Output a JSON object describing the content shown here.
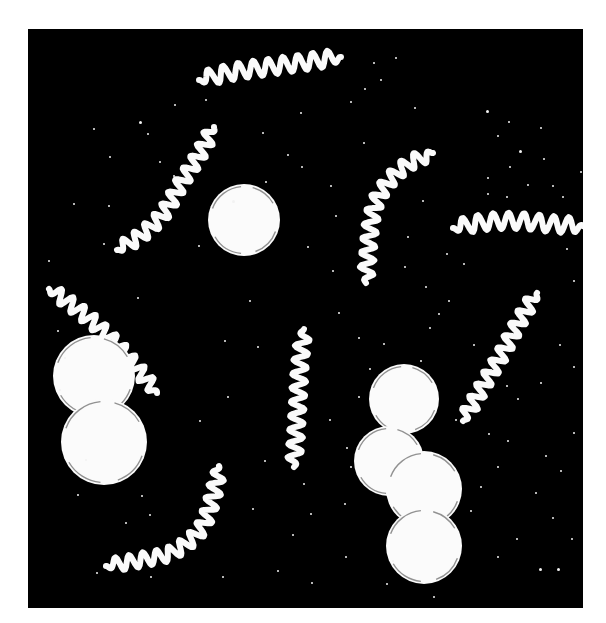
{
  "figure": {
    "kind": "darkfield-micrograph-illustration",
    "caption": "",
    "canvas": {
      "width": 606,
      "height": 623
    },
    "background_color": "#ffffff",
    "plate": {
      "x": 28,
      "y": 29,
      "width": 555,
      "height": 579,
      "fill_color": "#000000"
    },
    "organism_color": "#fafafa",
    "speck_color": "#f2f2f2"
  },
  "cocci": [
    {
      "name": "solitary-coccus",
      "cx": 244,
      "cy": 220,
      "r": 36
    },
    {
      "name": "diplococcus-upper",
      "cx": 94,
      "cy": 376,
      "r": 41
    },
    {
      "name": "diplococcus-lower",
      "cx": 104,
      "cy": 442,
      "r": 43
    },
    {
      "name": "chain-coccus-1",
      "cx": 404,
      "cy": 399,
      "r": 35
    },
    {
      "name": "chain-coccus-2",
      "cx": 389,
      "cy": 461,
      "r": 35
    },
    {
      "name": "chain-coccus-3",
      "cx": 424,
      "cy": 489,
      "r": 38
    },
    {
      "name": "chain-coccus-4",
      "cx": 424,
      "cy": 546,
      "r": 38
    }
  ],
  "spirochetes": [
    {
      "name": "spirochete-top",
      "points": [
        [
          199,
          80
        ],
        [
          232,
          72
        ],
        [
          268,
          67
        ],
        [
          305,
          62
        ],
        [
          341,
          57
        ]
      ],
      "amplitude": 8,
      "wavelength": 15,
      "thickness": 6
    },
    {
      "name": "spirochete-upper-left-s",
      "points": [
        [
          117,
          250
        ],
        [
          140,
          236
        ],
        [
          163,
          214
        ],
        [
          180,
          185
        ],
        [
          199,
          155
        ],
        [
          214,
          127
        ]
      ],
      "amplitude": 7,
      "wavelength": 14,
      "thickness": 6
    },
    {
      "name": "spirochete-left-diagonal",
      "points": [
        [
          49,
          289
        ],
        [
          76,
          308
        ],
        [
          104,
          332
        ],
        [
          130,
          360
        ],
        [
          157,
          393
        ]
      ],
      "amplitude": 7,
      "wavelength": 14,
      "thickness": 6
    },
    {
      "name": "spirochete-center-vertical",
      "points": [
        [
          304,
          329
        ],
        [
          300,
          365
        ],
        [
          298,
          400
        ],
        [
          296,
          433
        ],
        [
          294,
          467
        ]
      ],
      "amplitude": 7,
      "wavelength": 14,
      "thickness": 6
    },
    {
      "name": "spirochete-bottom-left-hook",
      "points": [
        [
          106,
          566
        ],
        [
          140,
          560
        ],
        [
          173,
          552
        ],
        [
          200,
          530
        ],
        [
          213,
          497
        ],
        [
          219,
          466
        ]
      ],
      "amplitude": 7,
      "wavelength": 14,
      "thickness": 6
    },
    {
      "name": "spirochete-upper-right-hook",
      "points": [
        [
          433,
          153
        ],
        [
          410,
          163
        ],
        [
          390,
          180
        ],
        [
          375,
          205
        ],
        [
          369,
          240
        ],
        [
          366,
          283
        ]
      ],
      "amplitude": 7,
      "wavelength": 14,
      "thickness": 6
    },
    {
      "name": "spirochete-right-horizontal",
      "points": [
        [
          453,
          228
        ],
        [
          486,
          222
        ],
        [
          519,
          221
        ],
        [
          552,
          224
        ],
        [
          583,
          226
        ]
      ],
      "amplitude": 8,
      "wavelength": 15,
      "thickness": 6
    },
    {
      "name": "spirochete-right-diagonal",
      "points": [
        [
          463,
          421
        ],
        [
          483,
          386
        ],
        [
          503,
          352
        ],
        [
          520,
          320
        ],
        [
          537,
          293
        ]
      ],
      "amplitude": 7,
      "wavelength": 14,
      "thickness": 6
    }
  ],
  "specks": [
    {
      "x": 139,
      "y": 121,
      "s": 3
    },
    {
      "x": 147,
      "y": 133,
      "s": 2
    },
    {
      "x": 109,
      "y": 156,
      "s": 2
    },
    {
      "x": 108,
      "y": 205,
      "s": 2
    },
    {
      "x": 159,
      "y": 161,
      "s": 2
    },
    {
      "x": 173,
      "y": 175,
      "s": 2
    },
    {
      "x": 103,
      "y": 243,
      "s": 2
    },
    {
      "x": 232,
      "y": 200,
      "s": 3
    },
    {
      "x": 265,
      "y": 181,
      "s": 2
    },
    {
      "x": 198,
      "y": 245,
      "s": 2
    },
    {
      "x": 300,
      "y": 112,
      "s": 2
    },
    {
      "x": 373,
      "y": 62,
      "s": 2
    },
    {
      "x": 395,
      "y": 57,
      "s": 2
    },
    {
      "x": 380,
      "y": 79,
      "s": 2
    },
    {
      "x": 350,
      "y": 101,
      "s": 2
    },
    {
      "x": 364,
      "y": 88,
      "s": 2
    },
    {
      "x": 414,
      "y": 107,
      "s": 2
    },
    {
      "x": 363,
      "y": 142,
      "s": 2
    },
    {
      "x": 486,
      "y": 110,
      "s": 3
    },
    {
      "x": 508,
      "y": 121,
      "s": 2
    },
    {
      "x": 497,
      "y": 135,
      "s": 2
    },
    {
      "x": 519,
      "y": 150,
      "s": 3
    },
    {
      "x": 540,
      "y": 127,
      "s": 2
    },
    {
      "x": 543,
      "y": 158,
      "s": 2
    },
    {
      "x": 509,
      "y": 166,
      "s": 2
    },
    {
      "x": 487,
      "y": 177,
      "s": 2
    },
    {
      "x": 527,
      "y": 184,
      "s": 2
    },
    {
      "x": 552,
      "y": 185,
      "s": 2
    },
    {
      "x": 487,
      "y": 193,
      "s": 2
    },
    {
      "x": 506,
      "y": 196,
      "s": 2
    },
    {
      "x": 562,
      "y": 196,
      "s": 2
    },
    {
      "x": 580,
      "y": 171,
      "s": 2
    },
    {
      "x": 330,
      "y": 185,
      "s": 2
    },
    {
      "x": 335,
      "y": 215,
      "s": 2
    },
    {
      "x": 307,
      "y": 246,
      "s": 2
    },
    {
      "x": 332,
      "y": 270,
      "s": 2
    },
    {
      "x": 446,
      "y": 253,
      "s": 2
    },
    {
      "x": 463,
      "y": 263,
      "s": 2
    },
    {
      "x": 57,
      "y": 330,
      "s": 2
    },
    {
      "x": 59,
      "y": 389,
      "s": 2
    },
    {
      "x": 64,
      "y": 357,
      "s": 2
    },
    {
      "x": 48,
      "y": 260,
      "s": 2
    },
    {
      "x": 73,
      "y": 203,
      "s": 2
    },
    {
      "x": 137,
      "y": 297,
      "s": 2
    },
    {
      "x": 85,
      "y": 459,
      "s": 2
    },
    {
      "x": 77,
      "y": 494,
      "s": 2
    },
    {
      "x": 141,
      "y": 495,
      "s": 2
    },
    {
      "x": 149,
      "y": 514,
      "s": 2
    },
    {
      "x": 125,
      "y": 522,
      "s": 2
    },
    {
      "x": 199,
      "y": 420,
      "s": 2
    },
    {
      "x": 227,
      "y": 396,
      "s": 2
    },
    {
      "x": 224,
      "y": 340,
      "s": 2
    },
    {
      "x": 257,
      "y": 346,
      "s": 2
    },
    {
      "x": 249,
      "y": 300,
      "s": 2
    },
    {
      "x": 264,
      "y": 460,
      "s": 2
    },
    {
      "x": 252,
      "y": 508,
      "s": 2
    },
    {
      "x": 292,
      "y": 534,
      "s": 2
    },
    {
      "x": 277,
      "y": 570,
      "s": 2
    },
    {
      "x": 222,
      "y": 576,
      "s": 2
    },
    {
      "x": 150,
      "y": 576,
      "s": 2
    },
    {
      "x": 96,
      "y": 572,
      "s": 2
    },
    {
      "x": 311,
      "y": 582,
      "s": 2
    },
    {
      "x": 345,
      "y": 556,
      "s": 2
    },
    {
      "x": 344,
      "y": 503,
      "s": 2
    },
    {
      "x": 350,
      "y": 466,
      "s": 2
    },
    {
      "x": 346,
      "y": 447,
      "s": 2
    },
    {
      "x": 329,
      "y": 419,
      "s": 2
    },
    {
      "x": 303,
      "y": 483,
      "s": 2
    },
    {
      "x": 310,
      "y": 513,
      "s": 2
    },
    {
      "x": 338,
      "y": 312,
      "s": 2
    },
    {
      "x": 358,
      "y": 337,
      "s": 2
    },
    {
      "x": 383,
      "y": 343,
      "s": 2
    },
    {
      "x": 473,
      "y": 344,
      "s": 2
    },
    {
      "x": 490,
      "y": 369,
      "s": 2
    },
    {
      "x": 506,
      "y": 385,
      "s": 2
    },
    {
      "x": 517,
      "y": 398,
      "s": 2
    },
    {
      "x": 540,
      "y": 382,
      "s": 2
    },
    {
      "x": 559,
      "y": 344,
      "s": 2
    },
    {
      "x": 573,
      "y": 366,
      "s": 2
    },
    {
      "x": 545,
      "y": 455,
      "s": 2
    },
    {
      "x": 573,
      "y": 432,
      "s": 2
    },
    {
      "x": 560,
      "y": 470,
      "s": 2
    },
    {
      "x": 535,
      "y": 492,
      "s": 2
    },
    {
      "x": 552,
      "y": 517,
      "s": 2
    },
    {
      "x": 571,
      "y": 538,
      "s": 2
    },
    {
      "x": 516,
      "y": 538,
      "s": 2
    },
    {
      "x": 497,
      "y": 556,
      "s": 2
    },
    {
      "x": 539,
      "y": 568,
      "s": 3
    },
    {
      "x": 557,
      "y": 568,
      "s": 3
    },
    {
      "x": 470,
      "y": 510,
      "s": 2
    },
    {
      "x": 480,
      "y": 486,
      "s": 2
    },
    {
      "x": 497,
      "y": 466,
      "s": 2
    },
    {
      "x": 488,
      "y": 433,
      "s": 2
    },
    {
      "x": 507,
      "y": 440,
      "s": 2
    },
    {
      "x": 470,
      "y": 401,
      "s": 2
    },
    {
      "x": 455,
      "y": 419,
      "s": 2
    },
    {
      "x": 433,
      "y": 596,
      "s": 2
    },
    {
      "x": 386,
      "y": 583,
      "s": 2
    },
    {
      "x": 392,
      "y": 560,
      "s": 2
    },
    {
      "x": 573,
      "y": 280,
      "s": 2
    },
    {
      "x": 566,
      "y": 248,
      "s": 2
    },
    {
      "x": 448,
      "y": 300,
      "s": 2
    },
    {
      "x": 429,
      "y": 327,
      "s": 2
    },
    {
      "x": 420,
      "y": 360,
      "s": 2
    },
    {
      "x": 369,
      "y": 368,
      "s": 2
    },
    {
      "x": 358,
      "y": 396,
      "s": 2
    },
    {
      "x": 93,
      "y": 128,
      "s": 2
    },
    {
      "x": 174,
      "y": 104,
      "s": 2
    },
    {
      "x": 205,
      "y": 99,
      "s": 2
    },
    {
      "x": 262,
      "y": 132,
      "s": 2
    },
    {
      "x": 287,
      "y": 154,
      "s": 2
    },
    {
      "x": 301,
      "y": 166,
      "s": 2
    },
    {
      "x": 422,
      "y": 200,
      "s": 2
    },
    {
      "x": 407,
      "y": 236,
      "s": 2
    },
    {
      "x": 404,
      "y": 266,
      "s": 2
    },
    {
      "x": 425,
      "y": 286,
      "s": 2
    },
    {
      "x": 438,
      "y": 313,
      "s": 2
    }
  ]
}
